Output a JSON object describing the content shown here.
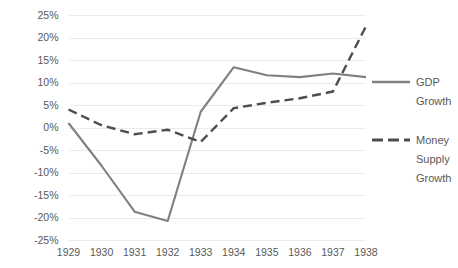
{
  "chart_data": {
    "type": "line",
    "title": "",
    "xlabel": "",
    "ylabel": "",
    "x": [
      "1929",
      "1930",
      "1931",
      "1932",
      "1933",
      "1934",
      "1935",
      "1936",
      "1937",
      "1938"
    ],
    "categories": [
      "1929",
      "1930",
      "1931",
      "1932",
      "1933",
      "1934",
      "1935",
      "1936",
      "1937",
      "1938"
    ],
    "series": [
      {
        "name": "GDP Growth",
        "style": "solid",
        "color": "#808080",
        "values": [
          1.0,
          -8.5,
          -18.7,
          -20.8,
          3.5,
          13.4,
          11.6,
          11.2,
          12.0,
          11.2
        ]
      },
      {
        "name": "Money Supply Growth",
        "style": "dashed",
        "color": "#4d4d4d",
        "values": [
          4.0,
          0.5,
          -1.5,
          -0.5,
          -3.2,
          4.3,
          5.5,
          6.5,
          8.0,
          22.5
        ]
      }
    ],
    "ylim": [
      -25,
      25
    ],
    "ytick_step": 5,
    "ytick_labels": [
      "25%",
      "20%",
      "15%",
      "10%",
      "5%",
      "0%",
      "-5%",
      "-10%",
      "-15%",
      "-20%",
      "-25%"
    ],
    "ytick_values": [
      25,
      20,
      15,
      10,
      5,
      0,
      -5,
      -10,
      -15,
      -20,
      -25
    ],
    "grid": true,
    "grid_color": "#ebebeb",
    "legend_position": "right",
    "legend": [
      {
        "label_line1": "GDP",
        "label_line2": "Growth",
        "style": "solid",
        "color": "#808080"
      },
      {
        "label_line1": "Money",
        "label_line2": "Supply",
        "label_line3": "Growth",
        "style": "dashed",
        "color": "#4d4d4d"
      }
    ],
    "axis_label_color": "#595959"
  }
}
